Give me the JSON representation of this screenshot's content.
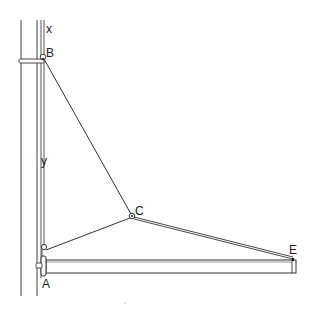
{
  "diagram": {
    "type": "mechanical-structure",
    "labels": {
      "x": "x",
      "B": "B",
      "y": "y",
      "C": "C",
      "A": "A",
      "E": "E"
    },
    "colors": {
      "line": "#333333",
      "background": "#ffffff"
    }
  }
}
